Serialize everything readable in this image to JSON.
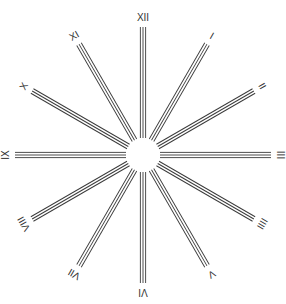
{
  "diagram": {
    "type": "clock-dial-rays",
    "center": [
      143,
      155
    ],
    "inner_radius": 17,
    "outer_radius": 128,
    "label_radius": 137,
    "line_color": "#3a3a3a",
    "hours": [
      {
        "label": "XII"
      },
      {
        "label": "I"
      },
      {
        "label": "II"
      },
      {
        "label": "III"
      },
      {
        "label": "IIII"
      },
      {
        "label": "V"
      },
      {
        "label": "VI"
      },
      {
        "label": "VII"
      },
      {
        "label": "VIII"
      },
      {
        "label": "IX"
      },
      {
        "label": "X"
      },
      {
        "label": "XI"
      }
    ]
  }
}
